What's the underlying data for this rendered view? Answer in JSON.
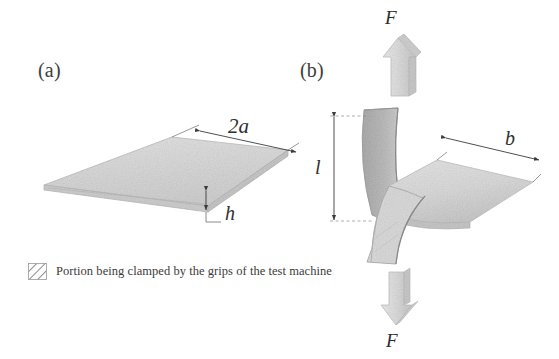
{
  "figure": {
    "background_color": "#ffffff",
    "width": 559,
    "height": 359
  },
  "panels": [
    {
      "id": "a",
      "label": "(a)",
      "description": "flat rectangular plate specimen in oblique projection",
      "dimensions": [
        {
          "symbol": "2a",
          "meaning": "plate width across the long top edge"
        },
        {
          "symbol": "h",
          "meaning": "plate thickness"
        }
      ]
    },
    {
      "id": "b",
      "label": "(b)",
      "description": "S-shaped bent strip specimen loaded in tension between grips",
      "dimensions": [
        {
          "symbol": "l",
          "meaning": "gauge length between clamped portions"
        },
        {
          "symbol": "b",
          "meaning": "width of the strip"
        }
      ],
      "forces": [
        {
          "symbol": "F",
          "position": "top",
          "direction": "up"
        },
        {
          "symbol": "F",
          "position": "bottom",
          "direction": "down"
        }
      ]
    }
  ],
  "labels": {
    "panel_a": "(a)",
    "panel_b": "(b)",
    "dim_2a": "2a",
    "dim_h": "h",
    "dim_l": "l",
    "dim_b": "b",
    "force_top": "F",
    "force_bottom": "F"
  },
  "legend": {
    "swatch": "diagonal-hatch-swatch",
    "text": "Portion being clamped by the grips of the test machine"
  },
  "colors": {
    "background": "#ffffff",
    "plate_top_face": "#dcdcdc",
    "plate_edge_face": "#c9c9c9",
    "clamped_region": "#b9b9b9",
    "strip_light": "#dedede",
    "strip_mid": "#cfcfcf",
    "arrow_fill": "#dcdcdc",
    "arrow_side": "#c4c4c4",
    "outline": "#8f8f8f",
    "dimension_line": "#4a4a4a",
    "text": "#333333"
  }
}
